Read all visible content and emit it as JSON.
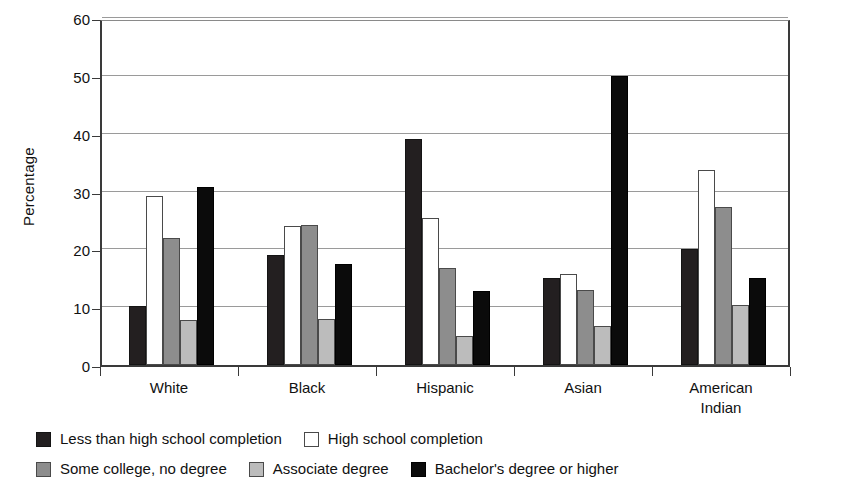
{
  "chart_data": {
    "type": "bar",
    "title": "",
    "xlabel": "",
    "ylabel": "Percentage",
    "ylim": [
      0,
      60
    ],
    "yticks": [
      0,
      10,
      20,
      30,
      40,
      50,
      60
    ],
    "grid": true,
    "legend_position": "bottom",
    "categories": [
      "White",
      "Black",
      "Hispanic",
      "Asian",
      "American Indian"
    ],
    "category_labels": [
      [
        "White"
      ],
      [
        "Black"
      ],
      [
        "Hispanic"
      ],
      [
        "Asian"
      ],
      [
        "American",
        "Indian"
      ]
    ],
    "series": [
      {
        "name": "Less than high school completion",
        "color": "#231f20",
        "values": [
          10.2,
          19.0,
          39.0,
          15.0,
          20.1
        ]
      },
      {
        "name": "High school completion",
        "color": "#ffffff",
        "values": [
          29.3,
          24.1,
          25.5,
          15.7,
          33.7
        ]
      },
      {
        "name": "Some college, no degree",
        "color": "#8d8d8d",
        "values": [
          22.0,
          24.2,
          16.7,
          13.0,
          27.3
        ]
      },
      {
        "name": "Associate degree",
        "color": "#bcbcbc",
        "values": [
          7.8,
          8.0,
          5.0,
          6.8,
          10.4
        ]
      },
      {
        "name": "Bachelor's degree or higher",
        "color": "#0b0b0b",
        "values": [
          30.8,
          17.5,
          12.8,
          50.0,
          15.0
        ]
      }
    ]
  },
  "legend": {
    "rows": [
      [
        {
          "label": "Less than high school completion",
          "swatch": "dark-textured-swatch"
        },
        {
          "label": "High school completion",
          "swatch": "white-swatch"
        }
      ],
      [
        {
          "label": "Some college, no degree",
          "swatch": "medium-gray-swatch"
        },
        {
          "label": "Associate degree",
          "swatch": "light-gray-swatch"
        },
        {
          "label": "Bachelor's degree or higher",
          "swatch": "black-swatch"
        }
      ]
    ]
  }
}
